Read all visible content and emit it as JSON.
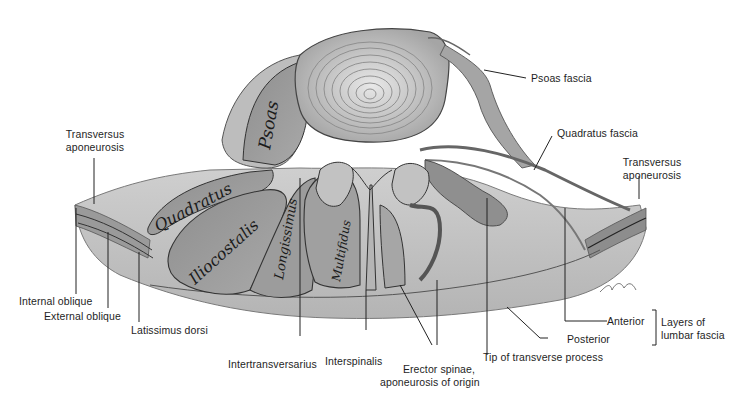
{
  "figure": {
    "style": "grayscale pencil anatomical illustration",
    "colors": {
      "background": "#ffffff",
      "tissue_light": "#d9d9d9",
      "tissue_mid": "#a8a8a8",
      "tissue_dark": "#6e6e6e",
      "outline": "#2b2b2b",
      "label_text": "#1e1e1e",
      "leader_line": "#222222"
    }
  },
  "muscle_labels": {
    "psoas": "Psoas",
    "quadratus": "Quadratus",
    "iliocostalis": "Iliocostalis",
    "longissimus": "Longissimus",
    "multifidus": "Multifidus"
  },
  "labels": {
    "psoas_fascia": "Psoas fascia",
    "quadratus_fascia": "Quadratus fascia",
    "transversus_aponeurosis_left_1": "Transversus",
    "transversus_aponeurosis_left_2": "aponeurosis",
    "transversus_aponeurosis_right_1": "Transversus",
    "transversus_aponeurosis_right_2": "aponeurosis",
    "internal_oblique": "Internal oblique",
    "external_oblique": "External oblique",
    "latissimus_dorsi": "Latissimus dorsi",
    "intertransversarius": "Intertransversarius",
    "interspinalis": "Interspinalis",
    "erector_spinae_1": "Erector spinae,",
    "erector_spinae_2": "aponeurosis of origin",
    "tip_transverse_process": "Tip of transverse process",
    "anterior": "Anterior",
    "posterior": "Posterior",
    "layers_lumbar_fascia_1": "Layers of",
    "layers_lumbar_fascia_2": "lumbar fascia"
  }
}
